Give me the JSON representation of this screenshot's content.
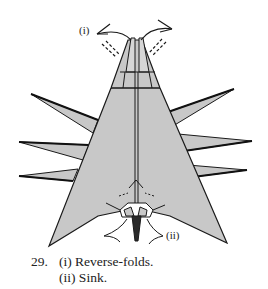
{
  "diagram": {
    "step_number": "29.",
    "instructions": [
      {
        "marker": "(i)",
        "text": "(i) Reverse-folds."
      },
      {
        "marker": "(ii)",
        "text": "(ii) Sink."
      }
    ],
    "labels": {
      "top_marker": "(i)",
      "bottom_marker": "(ii)"
    },
    "colors": {
      "paper": "#c8c8c8",
      "outline": "#1a1a1a",
      "background": "#ffffff"
    }
  }
}
